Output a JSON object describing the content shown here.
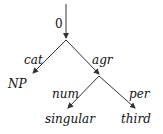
{
  "diagram": {
    "type": "feature-structure-dag",
    "root": {
      "label": "0"
    },
    "edges": [
      {
        "label": "cat",
        "from": "root",
        "to": "NP"
      },
      {
        "label": "agr",
        "from": "root",
        "to": "agr-node"
      },
      {
        "label": "num",
        "from": "agr-node",
        "to": "singular"
      },
      {
        "label": "per",
        "from": "agr-node",
        "to": "third"
      }
    ],
    "leaves": {
      "np": "NP",
      "singular": "singular",
      "third": "third"
    },
    "edge_labels": {
      "cat": "cat",
      "agr": "agr",
      "num": "num",
      "per": "per"
    },
    "colors": {
      "stroke": "#333333",
      "text": "#111111",
      "background": "#ffffff"
    }
  }
}
